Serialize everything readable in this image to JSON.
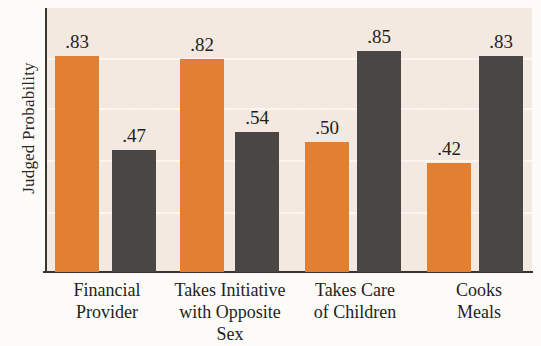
{
  "chart_data": {
    "type": "bar",
    "title": "",
    "xlabel": "",
    "ylabel": "Judged Probability",
    "ylim": [
      0,
      1.0
    ],
    "grid": true,
    "legend": "none",
    "categories": [
      "Financial Provider",
      "Takes Initiative with Opposite Sex",
      "Takes Care of Children",
      "Cooks Meals"
    ],
    "category_lines": [
      [
        "Financial",
        "Provider"
      ],
      [
        "Takes Initiative",
        "with Opposite",
        "Sex"
      ],
      [
        "Takes Care",
        "of Children"
      ],
      [
        "Cooks",
        "Meals"
      ]
    ],
    "series": [
      {
        "name": "series-1",
        "color": "#e08030",
        "values": [
          0.83,
          0.82,
          0.5,
          0.42
        ]
      },
      {
        "name": "series-2",
        "color": "#4a4644",
        "values": [
          0.47,
          0.54,
          0.85,
          0.83
        ]
      }
    ],
    "value_labels": [
      [
        ".83",
        ".82",
        ".50",
        ".42"
      ],
      [
        ".47",
        ".54",
        ".85",
        ".83"
      ]
    ]
  },
  "colors": {
    "orange": "#e08030",
    "gray": "#4a4644",
    "plot_background": "#f6ece3",
    "page_background": "#fdfbf8",
    "axis": "#3a3431",
    "gridline": "#fdf6ef",
    "text": "#221f1d"
  },
  "axis": {
    "y_title": "Judged Probability"
  },
  "bars": [
    {
      "name": "financial-provider-orange",
      "label": ".83",
      "value": 0.83,
      "series": 0,
      "x": 55,
      "w": 44
    },
    {
      "name": "financial-provider-gray",
      "label": ".47",
      "value": 0.47,
      "series": 1,
      "x": 112,
      "w": 44
    },
    {
      "name": "takes-initiative-orange",
      "label": ".82",
      "value": 0.82,
      "series": 0,
      "x": 180,
      "w": 44
    },
    {
      "name": "takes-initiative-gray",
      "label": ".54",
      "value": 0.54,
      "series": 1,
      "x": 235,
      "w": 44
    },
    {
      "name": "takes-care-orange",
      "label": ".50",
      "value": 0.5,
      "series": 0,
      "x": 305,
      "w": 44
    },
    {
      "name": "takes-care-gray",
      "label": ".85",
      "value": 0.85,
      "series": 1,
      "x": 357,
      "w": 44
    },
    {
      "name": "cooks-meals-orange",
      "label": ".42",
      "value": 0.42,
      "series": 0,
      "x": 427,
      "w": 44
    },
    {
      "name": "cooks-meals-gray",
      "label": ".83",
      "value": 0.83,
      "series": 1,
      "x": 479,
      "w": 44
    }
  ],
  "categories_layout": [
    {
      "name": "financial-provider",
      "x": 48,
      "w": 118
    },
    {
      "name": "takes-initiative",
      "x": 166,
      "w": 128
    },
    {
      "name": "takes-care",
      "x": 296,
      "w": 118
    },
    {
      "name": "cooks-meals",
      "x": 424,
      "w": 110
    }
  ],
  "gridlines": [
    58,
    108,
    160,
    212
  ]
}
